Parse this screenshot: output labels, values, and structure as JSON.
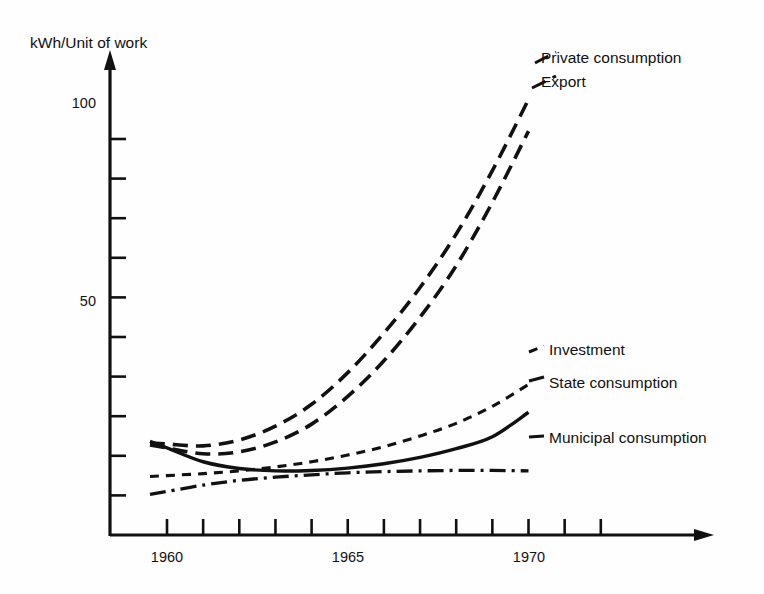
{
  "figure": {
    "y_axis_title": "kWh/Unit of work",
    "background_color": "#fefefe",
    "ink_color": "#111111"
  },
  "chart_data": {
    "type": "line",
    "title": "",
    "subtitle": "",
    "xlabel": "",
    "ylabel": "kWh/Unit of work",
    "xlim": [
      1959.5,
      1972.5
    ],
    "ylim": [
      0,
      118
    ],
    "grid": false,
    "legend_position": "right-inline-labels",
    "x_tick_values": [
      1960,
      1961,
      1962,
      1963,
      1964,
      1965,
      1966,
      1967,
      1968,
      1969,
      1970,
      1971,
      1972
    ],
    "x_tick_labels": [
      "1960",
      "",
      "",
      "",
      "",
      "1965",
      "",
      "",
      "",
      "",
      "1970",
      "",
      ""
    ],
    "y_tick_values": [
      10,
      20,
      30,
      40,
      50,
      60,
      70,
      80,
      90,
      100
    ],
    "y_tick_labels": [
      "",
      "",
      "",
      "",
      "50",
      "",
      "",
      "",
      "",
      "100"
    ],
    "x": [
      1960,
      1961,
      1962,
      1963,
      1964,
      1965,
      1966,
      1967,
      1968,
      1969,
      1970
    ],
    "series": [
      {
        "name": "Private consumption",
        "style": "long-dash",
        "label": "Private consumption",
        "values": [
          23.0,
          22.5,
          24.0,
          27.5,
          33.0,
          41.0,
          51.0,
          62.5,
          76.0,
          92.0,
          110.0
        ]
      },
      {
        "name": "Export",
        "style": "long-dash",
        "label": "Export",
        "values": [
          22.0,
          20.5,
          21.0,
          23.5,
          28.0,
          35.0,
          44.0,
          55.0,
          68.0,
          84.0,
          102.0
        ]
      },
      {
        "name": "Investment",
        "style": "short-dash",
        "label": "Investment",
        "values": [
          15.0,
          15.5,
          16.2,
          17.2,
          18.5,
          20.2,
          22.3,
          25.0,
          28.2,
          32.5,
          38.0
        ]
      },
      {
        "name": "State consumption",
        "style": "solid",
        "label": "State consumption",
        "values": [
          22.0,
          18.5,
          16.8,
          16.2,
          16.3,
          16.9,
          18.0,
          19.6,
          21.8,
          24.8,
          31.0
        ]
      },
      {
        "name": "Municipal consumption",
        "style": "dash-dot",
        "label": "Municipal consumption",
        "values": [
          11.0,
          12.6,
          13.8,
          14.6,
          15.2,
          15.7,
          16.0,
          16.2,
          16.3,
          16.3,
          16.2
        ]
      }
    ]
  },
  "labels": {
    "private_consumption": "Private consumption",
    "export": "Export",
    "investment": "Investment",
    "state_consumption": "State consumption",
    "municipal_consumption": "Municipal consumption"
  },
  "ticks": {
    "x_1960": "1960",
    "x_1965": "1965",
    "x_1970": "1970",
    "y_50": "50",
    "y_100": "100"
  }
}
